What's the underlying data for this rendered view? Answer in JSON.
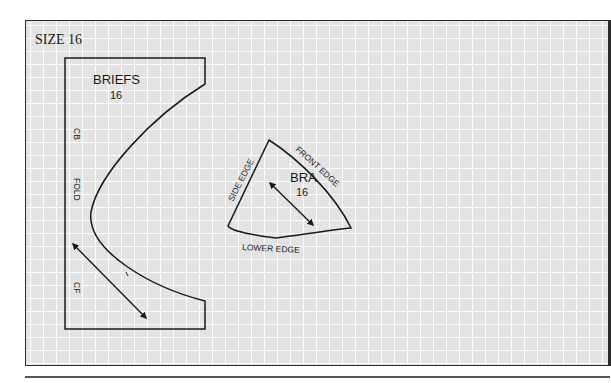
{
  "figure": {
    "size_label": "SIZE 16",
    "briefs": {
      "title": "BRIEFS",
      "size": "16",
      "labels": {
        "top": "CB",
        "middle": "FOLD",
        "bottom": "CF"
      }
    },
    "bra": {
      "title": "BRA",
      "size": "16",
      "edges": {
        "side": "SIDE EDGE",
        "front": "FRONT EDGE",
        "lower": "LOWER EDGE"
      }
    },
    "grid": {
      "spacing_px": 13,
      "background": "#e3e3e3",
      "line_color": "#ffffff"
    },
    "colors": {
      "ink": "#1a1a1a"
    }
  }
}
